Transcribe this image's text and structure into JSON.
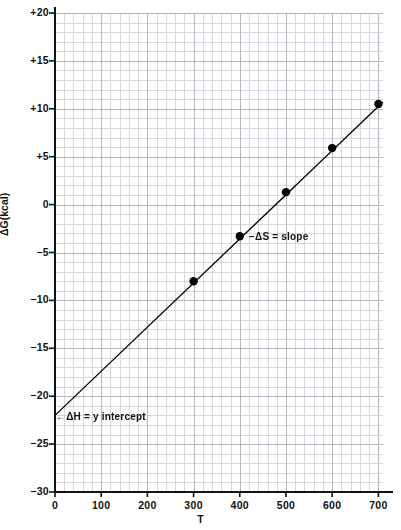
{
  "chart_data": {
    "type": "scatter",
    "title": "",
    "subtitle": "",
    "xlabel": "T",
    "ylabel": "ΔG(kcal)",
    "xlim": [
      0,
      710
    ],
    "ylim": [
      -30,
      20
    ],
    "grid": true,
    "grid_style": "graph-paper, minor squares with major line every 5 squares",
    "legend": "none",
    "x_ticks": [
      0,
      100,
      200,
      300,
      400,
      500,
      600,
      700
    ],
    "x_tick_labels": [
      "0",
      "100",
      "200",
      "300",
      "400",
      "500",
      "600",
      "700"
    ],
    "y_ticks": [
      20,
      15,
      10,
      5,
      0,
      -5,
      -10,
      -15,
      -20,
      -25,
      -30
    ],
    "y_tick_labels": [
      "+20",
      "+15",
      "+10",
      "+5",
      "0",
      "−5",
      "−10",
      "−15",
      "−20",
      "−25",
      "−30"
    ],
    "series": [
      {
        "name": "ΔG vs T",
        "marker": "filled-circle",
        "color": "#000000",
        "x": [
          300,
          400,
          500,
          600,
          700
        ],
        "values": [
          -8.0,
          -3.3,
          1.3,
          5.9,
          10.5
        ]
      }
    ],
    "fit_line": {
      "name": "least-squares line",
      "x_start": 0,
      "y_start": -22.0,
      "x_end": 710,
      "y_end": 10.7,
      "slope": 0.046,
      "intercept": -22.0,
      "color": "#000000"
    },
    "annotations": [
      {
        "id": "y-intercept",
        "text": "←ΔH = y intercept",
        "x": 0,
        "y": -22.0
      },
      {
        "id": "slope",
        "text": "−ΔS = slope",
        "x": 400,
        "y": -3.3
      }
    ],
    "colors": {
      "ink": "#111111",
      "grid_minor": "#d7d7dd",
      "grid_major": "#b6b6c0",
      "axis": "#111111",
      "background": "#ffffff"
    }
  }
}
